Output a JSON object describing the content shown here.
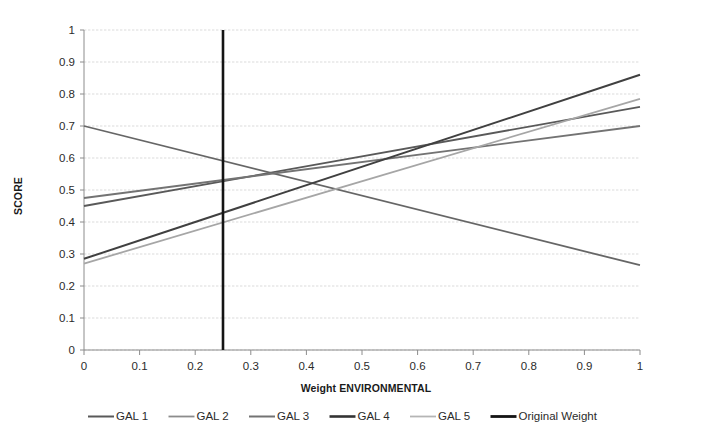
{
  "chart_data": {
    "type": "line",
    "title": "",
    "xlabel": "Weight ENVIRONMENTAL",
    "ylabel": "SCORE",
    "xlim": [
      0,
      1
    ],
    "ylim": [
      0,
      1
    ],
    "grid": true,
    "legend_position": "bottom",
    "x_ticks": [
      "0",
      "0.1",
      "0.2",
      "0.3",
      "0.4",
      "0.5",
      "0.6",
      "0.7",
      "0.8",
      "0.9",
      "1"
    ],
    "x_tick_values": [
      0,
      0.1,
      0.2,
      0.3,
      0.4,
      0.5,
      0.6,
      0.7,
      0.8,
      0.9,
      1
    ],
    "y_ticks": [
      "0",
      "0.1",
      "0.2",
      "0.3",
      "0.4",
      "0.5",
      "0.6",
      "0.7",
      "0.8",
      "0.9",
      "1"
    ],
    "y_tick_values": [
      0,
      0.1,
      0.2,
      0.3,
      0.4,
      0.5,
      0.6,
      0.7,
      0.8,
      0.9,
      1
    ],
    "x": [
      0,
      1
    ],
    "series": [
      {
        "name": "GAL 1",
        "values": [
          0.45,
          0.76
        ],
        "color": "#595959",
        "width": 1.8,
        "orientation": "diagonal"
      },
      {
        "name": "GAL 2",
        "values": [
          0.7,
          0.265
        ],
        "color": "#666666",
        "width": 1.8,
        "orientation": "diagonal"
      },
      {
        "name": "GAL 3",
        "values": [
          0.475,
          0.7
        ],
        "color": "#737373",
        "width": 1.8,
        "orientation": "diagonal"
      },
      {
        "name": "GAL 4",
        "values": [
          0.285,
          0.86
        ],
        "color": "#404040",
        "width": 2.0,
        "orientation": "diagonal"
      },
      {
        "name": "GAL 5",
        "values": [
          0.27,
          0.785
        ],
        "color": "#a6a6a6",
        "width": 1.8,
        "orientation": "diagonal"
      },
      {
        "name": "Original Weight",
        "values": [
          0.0,
          1.0
        ],
        "color": "#141414",
        "width": 2.6,
        "orientation": "vertical",
        "x_position": 0.25
      }
    ]
  },
  "legend": {
    "items": [
      {
        "label": "GAL 1",
        "color": "#595959",
        "width": 2.0
      },
      {
        "label": "GAL 2",
        "color": "#8c8c8c",
        "width": 1.8
      },
      {
        "label": "GAL 3",
        "color": "#737373",
        "width": 2.0
      },
      {
        "label": "GAL 4",
        "color": "#333333",
        "width": 2.6
      },
      {
        "label": "GAL 5",
        "color": "#b5b5b5",
        "width": 1.8
      },
      {
        "label": "Original Weight",
        "color": "#141414",
        "width": 2.8
      }
    ]
  },
  "axes": {
    "x_title": "Weight ENVIRONMENTAL",
    "y_title": "SCORE"
  }
}
